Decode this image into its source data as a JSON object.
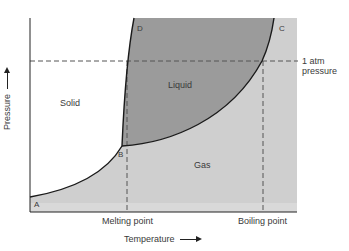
{
  "diagram": {
    "regions": {
      "solid": "Solid",
      "liquid": "Liquid",
      "gas": "Gas"
    },
    "points": {
      "a": "A",
      "b": "B",
      "c": "C",
      "d": "D"
    },
    "reference_line": {
      "line1": "1 atm",
      "line2": "pressure"
    },
    "x_ticks": {
      "melting": "Melting point",
      "boiling": "Boiling point"
    },
    "axes": {
      "x_label": "Temperature",
      "y_label": "Pressure"
    },
    "colors": {
      "liquid_fill": "#9b9b9b",
      "gas_fill": "#cfcfcf",
      "solid_fill": "#ffffff",
      "curve": "#1a1a1a",
      "dashed": "#555555"
    }
  }
}
